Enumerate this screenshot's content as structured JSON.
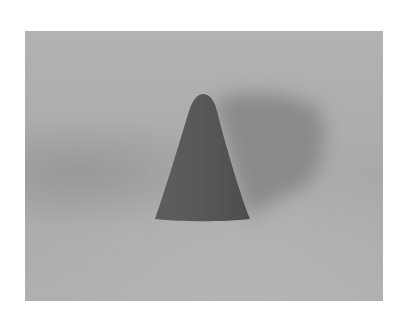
{
  "image": {
    "subject": "cone",
    "description": "Grayscale photograph of a dark rounded-tip cone standing on a gray surface, casting a soft shadow to the upper right",
    "colors": {
      "page_background": "#ffffff",
      "surface": "#adadad",
      "cone": "#565656",
      "cone_highlight": "#626262",
      "shadow": "#8a8a8a"
    }
  }
}
